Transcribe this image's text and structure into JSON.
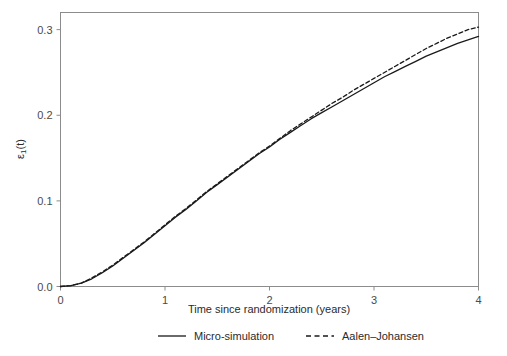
{
  "chart_data": {
    "type": "line",
    "title": "",
    "subtitle": "",
    "xlabel": "Time since randomization (years)",
    "ylabel": "ε₁(t)",
    "ylabel_parts": {
      "symbol": "ε",
      "subscript": "1",
      "suffix": "(t)"
    },
    "xlim": [
      0,
      4
    ],
    "ylim": [
      0.0,
      0.32
    ],
    "xticks": [
      0,
      1,
      2,
      3,
      4
    ],
    "xtick_labels": [
      "0",
      "1",
      "2",
      "3",
      "4"
    ],
    "yticks": [
      0.0,
      0.1,
      0.2,
      0.3
    ],
    "ytick_labels": [
      "0.0",
      "0.1",
      "0.2",
      "0.3"
    ],
    "grid": false,
    "frame": true,
    "legend_position": "bottom-outside",
    "x": [
      0.0,
      0.1,
      0.2,
      0.3,
      0.4,
      0.5,
      0.6,
      0.7,
      0.8,
      0.9,
      1.0,
      1.1,
      1.2,
      1.3,
      1.4,
      1.5,
      1.6,
      1.7,
      1.8,
      1.9,
      2.0,
      2.1,
      2.2,
      2.3,
      2.4,
      2.5,
      2.6,
      2.7,
      2.8,
      2.9,
      3.0,
      3.1,
      3.2,
      3.3,
      3.4,
      3.5,
      3.6,
      3.7,
      3.8,
      3.9,
      4.0
    ],
    "series": [
      {
        "name": "Micro-simulation",
        "style": "solid",
        "color": "#1a1a1a",
        "values": [
          0.0,
          0.001,
          0.004,
          0.009,
          0.016,
          0.024,
          0.033,
          0.042,
          0.051,
          0.061,
          0.071,
          0.081,
          0.09,
          0.1,
          0.11,
          0.119,
          0.128,
          0.137,
          0.146,
          0.155,
          0.163,
          0.172,
          0.18,
          0.188,
          0.196,
          0.203,
          0.21,
          0.217,
          0.224,
          0.231,
          0.238,
          0.245,
          0.251,
          0.257,
          0.263,
          0.269,
          0.274,
          0.279,
          0.284,
          0.288,
          0.292
        ]
      },
      {
        "name": "Aalen–Johansen",
        "style": "dashed",
        "color": "#1a1a1a",
        "values": [
          0.0,
          0.001,
          0.004,
          0.01,
          0.017,
          0.025,
          0.034,
          0.043,
          0.052,
          0.062,
          0.072,
          0.082,
          0.091,
          0.101,
          0.111,
          0.12,
          0.129,
          0.138,
          0.147,
          0.156,
          0.164,
          0.173,
          0.182,
          0.19,
          0.198,
          0.206,
          0.214,
          0.221,
          0.229,
          0.236,
          0.243,
          0.25,
          0.257,
          0.264,
          0.271,
          0.278,
          0.284,
          0.29,
          0.295,
          0.3,
          0.303
        ]
      }
    ],
    "legend": [
      {
        "label": "Micro-simulation",
        "style": "solid"
      },
      {
        "label": "Aalen–Johansen",
        "style": "dashed"
      }
    ],
    "annotations": []
  },
  "colors": {
    "background": "#ffffff",
    "frame": "#8c8c8c",
    "tick": "#8c8c8c",
    "text": "#2b2b2b",
    "curve": "#1a1a1a"
  }
}
